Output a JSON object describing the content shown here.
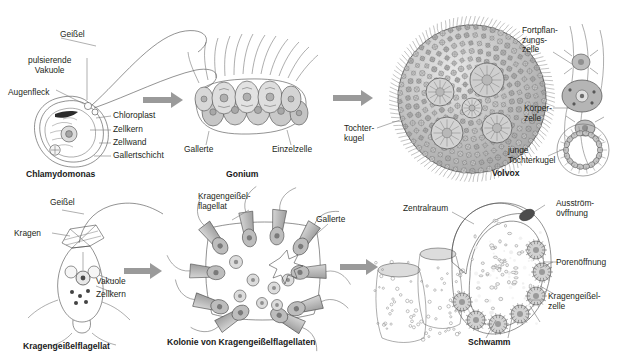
{
  "figure": {
    "background_color": "#ffffff",
    "ink_color": "#4a4a4a",
    "arrow_color": "#9a9a9a",
    "text_color": "#231f20"
  },
  "rows": [
    {
      "name": "green-algae-row",
      "panels": [
        {
          "id": "chlamydomonas",
          "caption": "Chlamydomonas",
          "labels": [
            "Geißel",
            "pulsierende\nVakuole",
            "Augenfleck",
            "Chloroplast",
            "Zellkern",
            "Zellwand",
            "Gallertschicht"
          ]
        },
        {
          "id": "gonium",
          "caption": "Gonium",
          "labels": [
            "Gallerte",
            "Einzelzelle"
          ]
        },
        {
          "id": "volvox",
          "caption": "Volvox",
          "labels": [
            "Tochter-\nkugel",
            "Fortpflan-\nzungs-\nzelle",
            "Körper-\nzelle",
            "junge\nTochterkugel"
          ]
        }
      ]
    },
    {
      "name": "choanoflagellate-row",
      "panels": [
        {
          "id": "kragengeisselflagellat",
          "caption": "Kragengeißelflagellat",
          "labels": [
            "Geißel",
            "Kragen",
            "Vakuole",
            "Zellkern"
          ]
        },
        {
          "id": "kolonie",
          "caption": "Kolonie von Kragengeißelflagellaten",
          "labels": [
            "Kragengeißel-\nflagellat",
            "Gallerte"
          ]
        },
        {
          "id": "schwamm",
          "caption": "Schwamm",
          "labels": [
            "Zentralraum",
            "Ausström-\növffnung",
            "Porenöffnung",
            "Kragengeißel-\nzelle"
          ]
        }
      ]
    }
  ],
  "labels": {
    "geissel_top": "Geißel",
    "pulsierende_vakuole": "pulsierende\nVakuole",
    "augenfleck": "Augenfleck",
    "chloroplast": "Chloroplast",
    "zellkern_top": "Zellkern",
    "zellwand": "Zellwand",
    "gallertschicht": "Gallertschicht",
    "gallerte_gonium": "Gallerte",
    "einzelzelle": "Einzelzelle",
    "tochterkugel": "Tochter-\nkugel",
    "fortpflanzungszelle": "Fortpflan-\nzungs-\nzelle",
    "koerperzelle": "Körper-\nzelle",
    "junge_tochterkugel": "junge\nTochterkugel",
    "geissel_bottom": "Geißel",
    "kragen": "Kragen",
    "vakuole": "Vakuole",
    "zellkern_bottom": "Zellkern",
    "kragengeisselflagellat_label": "Kragengeißel-\nflagellat",
    "gallerte_kolonie": "Gallerte",
    "zentralraum": "Zentralraum",
    "ausstroemoeffnung": "Ausström-\növffnung",
    "porenoeffnung": "Porenöffnung",
    "kragengeisselzelle": "Kragengeißel-\nzelle"
  },
  "captions": {
    "chlamydomonas": "Chlamydomonas",
    "gonium": "Gonium",
    "volvox": "Volvox",
    "kragengeisselflagellat": "Kragengeißelflagellat",
    "kolonie": "Kolonie von Kragengeißelflagellaten",
    "schwamm": "Schwamm"
  }
}
